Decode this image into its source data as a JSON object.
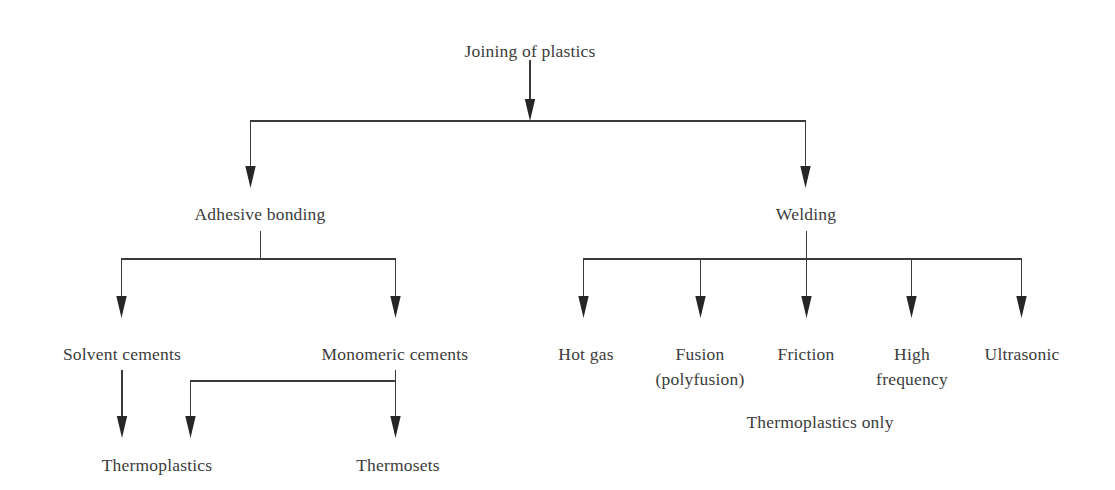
{
  "diagram": {
    "title": "Joining of plastics",
    "type": "tree-flowchart",
    "background_color": "#ffffff",
    "line_color": "#3a3a3a",
    "text_color": "#3c3c3c",
    "nodes": {
      "root": {
        "label": "Joining of plastics",
        "x": 530,
        "y": 50
      },
      "adhesive_bonding": {
        "label": "Adhesive bonding",
        "x": 260,
        "y": 213
      },
      "welding": {
        "label": "Welding",
        "x": 806,
        "y": 213
      },
      "solvent_cements": {
        "label": "Solvent cements",
        "x": 122,
        "y": 353
      },
      "monomeric_cements": {
        "label": "Monomeric cements",
        "x": 395,
        "y": 353
      },
      "hot_gas": {
        "label": "Hot gas",
        "x": 586,
        "y": 353
      },
      "fusion_line1": {
        "label": "Fusion",
        "x": 700,
        "y": 353
      },
      "fusion_line2": {
        "label": "(polyfusion)",
        "x": 700,
        "y": 378
      },
      "friction": {
        "label": "Friction",
        "x": 806,
        "y": 353
      },
      "high_line1": {
        "label": "High",
        "x": 912,
        "y": 353
      },
      "high_line2": {
        "label": "frequency",
        "x": 912,
        "y": 378
      },
      "ultrasonic": {
        "label": "Ultrasonic",
        "x": 1022,
        "y": 353
      },
      "thermoplastics": {
        "label": "Thermoplastics",
        "x": 157,
        "y": 464
      },
      "thermosets": {
        "label": "Thermosets",
        "x": 398,
        "y": 464
      },
      "thermoplastics_only": {
        "label": "Thermoplastics only",
        "x": 820,
        "y": 428
      }
    },
    "edges": [
      {
        "name": "root-stem",
        "from": "root",
        "to": "split-bar-1"
      },
      {
        "name": "split-to-adhesive",
        "from": "split-bar-1",
        "to": "adhesive_bonding"
      },
      {
        "name": "split-to-welding",
        "from": "split-bar-1",
        "to": "welding"
      },
      {
        "name": "adhesive-to-solvent",
        "from": "adhesive_bonding",
        "to": "solvent_cements"
      },
      {
        "name": "adhesive-to-monomeric",
        "from": "adhesive_bonding",
        "to": "monomeric_cements"
      },
      {
        "name": "welding-to-hot-gas",
        "from": "welding",
        "to": "hot_gas"
      },
      {
        "name": "welding-to-fusion",
        "from": "welding",
        "to": "fusion_line1"
      },
      {
        "name": "welding-to-friction",
        "from": "welding",
        "to": "friction"
      },
      {
        "name": "welding-to-high-frequency",
        "from": "welding",
        "to": "high_line1"
      },
      {
        "name": "welding-to-ultrasonic",
        "from": "welding",
        "to": "ultrasonic"
      },
      {
        "name": "solvent-to-thermoplastics",
        "from": "solvent_cements",
        "to": "thermoplastics"
      },
      {
        "name": "monomeric-to-thermoplastics",
        "from": "monomeric_cements",
        "to": "thermoplastics"
      },
      {
        "name": "monomeric-to-thermosets",
        "from": "monomeric_cements",
        "to": "thermosets"
      }
    ],
    "annotations": [
      {
        "name": "welding-note",
        "label": "Thermoplastics only"
      }
    ]
  }
}
